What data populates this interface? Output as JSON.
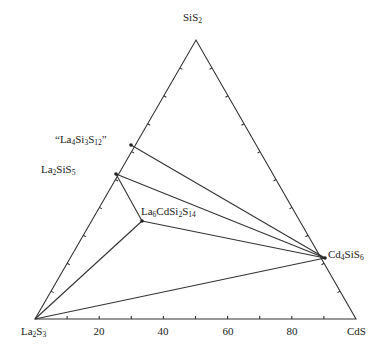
{
  "diagram": {
    "type": "ternary phase diagram",
    "vertices": {
      "top": {
        "label": "SiS",
        "sub": "2"
      },
      "left": {
        "label_parts": [
          [
            "La",
            "2"
          ],
          [
            "S",
            "3"
          ]
        ]
      },
      "right": {
        "label": "CdS"
      }
    },
    "axis_ticks": [
      "20",
      "40",
      "60",
      "80"
    ],
    "phases": [
      {
        "id": "la4si3s12",
        "parts": [
          [
            "“La",
            "4"
          ],
          [
            "Si",
            "3"
          ],
          [
            "S",
            "12"
          ],
          [
            "”",
            ""
          ]
        ]
      },
      {
        "id": "la2sis5",
        "parts": [
          [
            "La",
            "2"
          ],
          [
            "SiS",
            "5"
          ]
        ]
      },
      {
        "id": "la6cdsi2s14",
        "parts": [
          [
            "La",
            "6"
          ],
          [
            "CdSi",
            "2"
          ],
          [
            "S",
            "14"
          ]
        ]
      },
      {
        "id": "cd4sis6",
        "parts": [
          [
            "Cd",
            "4"
          ],
          [
            "SiS",
            "6"
          ]
        ]
      }
    ],
    "tie_lines": [
      [
        "la4si3s12",
        "cd4sis6"
      ],
      [
        "la2sis5",
        "cd4sis6"
      ],
      [
        "la2sis5",
        "la6cdsi2s14"
      ],
      [
        "la6cdsi2s14",
        "cd4sis6"
      ],
      [
        "la6cdsi2s14",
        "La2S3"
      ],
      [
        "La2S3",
        "cd4sis6"
      ]
    ],
    "line_color": "#333333"
  }
}
